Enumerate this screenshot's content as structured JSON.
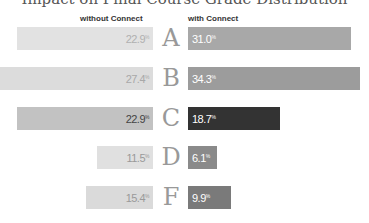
{
  "chart_data": {
    "type": "bar",
    "title": "Impact on Final Course Grade Distribution",
    "categories": [
      "A",
      "B",
      "C",
      "D",
      "F"
    ],
    "series": [
      {
        "name": "without Connect",
        "values": [
          22.9,
          27.4,
          22.9,
          11.5,
          15.4
        ]
      },
      {
        "name": "with Connect",
        "values": [
          31.0,
          34.3,
          18.7,
          6.1,
          9.9
        ]
      }
    ],
    "layout": "diverging horizontal bars, letter grades centered",
    "grid": false
  },
  "title": "Impact on Final Course Grade Distribution",
  "headers": {
    "left": "without Connect",
    "right": "with Connect"
  },
  "rows": [
    {
      "grade": "A",
      "left": "22.9",
      "right": "31.0",
      "lx": 17,
      "rw": 163,
      "y": 27,
      "lbg": "#e2e2e2",
      "lfg": "#b0b0b0",
      "rbg": "#a8a8a8"
    },
    {
      "grade": "B",
      "left": "27.4",
      "right": "34.3",
      "lx": 0,
      "rw": 172,
      "y": 67,
      "lbg": "#dcdcdc",
      "lfg": "#a8a8a8",
      "rbg": "#9c9c9c"
    },
    {
      "grade": "C",
      "left": "22.9",
      "right": "18.7",
      "lx": 17,
      "rw": 92,
      "y": 107,
      "lbg": "#c2c2c2",
      "lfg": "#444444",
      "rbg": "#333333"
    },
    {
      "grade": "D",
      "left": "11.5",
      "right": "6.1",
      "lx": 97,
      "rw": 29,
      "y": 146,
      "lbg": "#e0e0e0",
      "lfg": "#999999",
      "rbg": "#8a8a8a"
    },
    {
      "grade": "F",
      "left": "15.4",
      "right": "9.9",
      "lx": 86,
      "rw": 43,
      "y": 186,
      "lbg": "#dadada",
      "lfg": "#999999",
      "rbg": "#7a7a7a"
    }
  ],
  "percent_symbol": "%"
}
